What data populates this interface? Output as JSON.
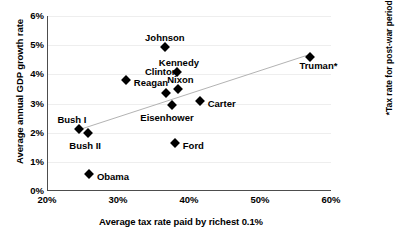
{
  "chart_data": {
    "type": "scatter",
    "title": "",
    "xlabel": "Average tax rate paid by richest 0.1%",
    "ylabel": "Average annual GDP growth rate",
    "xlim": [
      20,
      60
    ],
    "ylim": [
      0,
      6
    ],
    "xticks": [
      "20%",
      "30%",
      "40%",
      "50%",
      "60%"
    ],
    "xtick_values": [
      20,
      30,
      40,
      50,
      60
    ],
    "yticks": [
      "0%",
      "1%",
      "2%",
      "3%",
      "4%",
      "5%",
      "6%"
    ],
    "ytick_values": [
      0,
      1,
      2,
      3,
      4,
      5,
      6
    ],
    "grid": true,
    "legend": null,
    "annotation": "*Tax rate for post-war period only.",
    "trendline": {
      "visible": true,
      "x_start": 24.5,
      "y_start": 2.1,
      "x_end": 56.6,
      "y_end": 4.65
    },
    "points": [
      {
        "label": "Truman*",
        "x": 57.1,
        "y": 4.58,
        "label_dx": 8,
        "label_dy": 9
      },
      {
        "label": "Johnson",
        "x": 36.6,
        "y": 4.93,
        "label_dx": 0,
        "label_dy": -11
      },
      {
        "label": "Kennedy",
        "x": 38.3,
        "y": 4.07,
        "label_dx": 2,
        "label_dy": -11
      },
      {
        "label": "Nixon",
        "x": 38.5,
        "y": 3.5,
        "label_dx": 2,
        "label_dy": -11
      },
      {
        "label": "Clinton",
        "x": 36.8,
        "y": 3.35,
        "label_dx": -5,
        "label_dy": -23
      },
      {
        "label": "Reagan",
        "x": 31.1,
        "y": 3.8,
        "label_dx": 8,
        "label_dy": 3
      },
      {
        "label": "Carter",
        "x": 41.5,
        "y": 3.1,
        "label_dx": 8,
        "label_dy": 3
      },
      {
        "label": "Eisenhower",
        "x": 37.6,
        "y": 2.95,
        "label_dx": -5,
        "label_dy": 13
      },
      {
        "label": "Bush I",
        "x": 24.5,
        "y": 2.12,
        "label_dx": -7,
        "label_dy": -11
      },
      {
        "label": "Bush II",
        "x": 25.8,
        "y": 2.0,
        "label_dx": -3,
        "label_dy": 13
      },
      {
        "label": "Ford",
        "x": 38.0,
        "y": 1.63,
        "label_dx": 8,
        "label_dy": 3
      },
      {
        "label": "Obama",
        "x": 25.9,
        "y": 0.58,
        "label_dx": 8,
        "label_dy": 3
      }
    ]
  }
}
